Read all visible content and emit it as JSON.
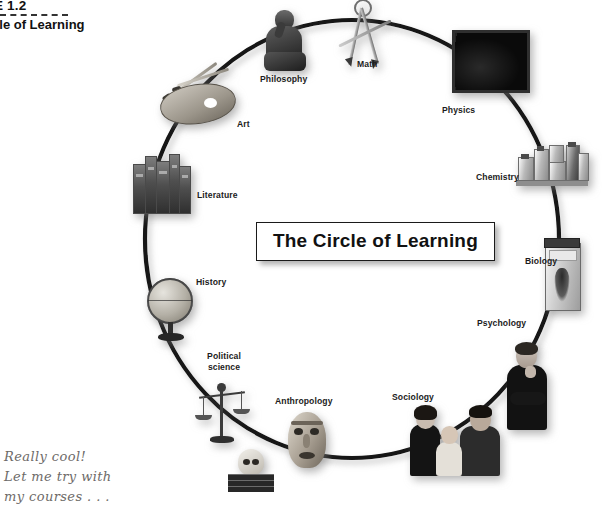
{
  "caption": {
    "figure_number": "URE 1.2",
    "figure_title": "Circle of Learning"
  },
  "center_banner": {
    "text": "The Circle of Learning"
  },
  "diagram": {
    "shape": "circle",
    "stroke_color": "#111111",
    "nodes": [
      {
        "label": "Math",
        "icon": "compass-icon",
        "position": "top"
      },
      {
        "label": "Physics",
        "icon": "chalkboard-icon",
        "position": "upper-right"
      },
      {
        "label": "Chemistry",
        "icon": "chemistry-bottles-icon",
        "position": "right-upper"
      },
      {
        "label": "Biology",
        "icon": "specimen-jar-icon",
        "position": "right"
      },
      {
        "label": "Psychology",
        "icon": "person-thinking-icon",
        "position": "right-lower"
      },
      {
        "label": "Sociology",
        "icon": "family-photo-icon",
        "position": "bottom-right"
      },
      {
        "label": "Anthropology",
        "icon": "tribal-mask-icon",
        "position": "bottom"
      },
      {
        "label": "Political\nscience",
        "icon": "balance-scales-icon",
        "position": "bottom-left"
      },
      {
        "label": "History",
        "icon": "globe-icon",
        "position": "left-lower"
      },
      {
        "label": "Literature",
        "icon": "books-icon",
        "position": "left"
      },
      {
        "label": "Art",
        "icon": "palette-brushes-icon",
        "position": "upper-left"
      },
      {
        "label": "Philosophy",
        "icon": "thinker-statue-icon",
        "position": "top-left"
      }
    ]
  },
  "labels": {
    "math": "Math",
    "physics": "Physics",
    "chemistry": "Chemistry",
    "biology": "Biology",
    "psychology": "Psychology",
    "sociology": "Sociology",
    "anthropology": "Anthropology",
    "political_science_line1": "Political",
    "political_science_line2": "science",
    "history": "History",
    "literature": "Literature",
    "art": "Art",
    "philosophy": "Philosophy"
  },
  "annotation": {
    "line1": "Really cool!",
    "line2": "Let me try with",
    "line3": "my courses . . ."
  }
}
